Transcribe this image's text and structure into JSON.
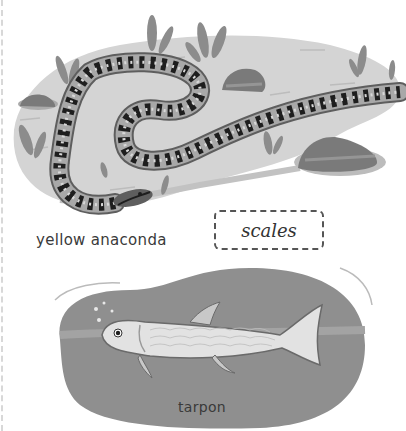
{
  "panels": [
    {
      "animal": "yellow anaconda",
      "scene": "snake coiled on grassy ground with rocks"
    },
    {
      "animal": "tarpon",
      "scene": "fish swimming in water"
    }
  ],
  "labels": {
    "snake": "yellow anaconda",
    "fish": "tarpon"
  },
  "word_box": {
    "word": "scales"
  },
  "colors": {
    "ground": "#d4d4d4",
    "grass": "#8c8c8c",
    "rock": "#7a7a7a",
    "snake_body": "#9a9a9a",
    "snake_spots": "#1e1e1e",
    "water": "#8f8f8f",
    "fish": "#e2e2e2"
  }
}
